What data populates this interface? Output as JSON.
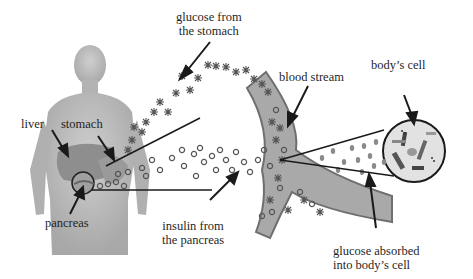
{
  "diagram": {
    "labels": {
      "glucose_from_stomach": [
        "glucose from",
        "the stomach"
      ],
      "blood_stream": "blood stream",
      "bodys_cell": "body’s cell",
      "liver": "liver",
      "stomach": "stomach",
      "pancreas": "pancreas",
      "insulin_from_pancreas": [
        "insulin from",
        "the pancreas"
      ],
      "glucose_absorbed": [
        "glucose absorbed",
        "into body’s cell"
      ]
    },
    "legend_symbols": {
      "glucose": "asterisk",
      "insulin": "small-ring"
    },
    "colors": {
      "background": "#ffffff",
      "body": "#b9b9b9",
      "organ": "#8a8a8a",
      "vessel_fill": "#a9a9a9",
      "vessel_edge": "#6f6f6f",
      "cell_fill": "#e2e2e2",
      "line": "#1a1a1a"
    }
  }
}
